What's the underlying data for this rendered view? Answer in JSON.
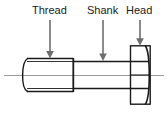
{
  "diagram": {
    "type": "engineering-line-drawing",
    "background_color": "#ffffff",
    "line_color": "#1a1a1a",
    "centerline_color": "#9a9a9a",
    "arrow_color": "#6e6e6e",
    "text_color": "#1a1a1a",
    "labels": [
      {
        "id": "thread",
        "text": "Thread",
        "x": 32,
        "y": 4,
        "arrow": {
          "x": 50,
          "from_y": 20,
          "to_y": 58
        }
      },
      {
        "id": "shank",
        "text": "Shank",
        "x": 87,
        "y": 4,
        "arrow": {
          "x": 103,
          "from_y": 20,
          "to_y": 60
        }
      },
      {
        "id": "head",
        "text": "Head",
        "x": 126,
        "y": 4,
        "arrow": {
          "x": 140,
          "from_y": 20,
          "to_y": 46
        }
      }
    ],
    "geometry": {
      "centerline": {
        "x1": 4,
        "x2": 164,
        "y": 75
      },
      "thread_section": {
        "x1": 27,
        "x2": 73,
        "top": 58,
        "bottom": 92
      },
      "chamfer_tip": {
        "x": 21,
        "top": 58,
        "bottom": 92
      },
      "shank_section": {
        "x1": 73,
        "x2": 130,
        "top": 61,
        "bottom": 89
      },
      "head_section": {
        "x1": 130,
        "x2": 150,
        "top": 46,
        "bottom": 104
      },
      "head_chamfer_lines_y": [
        61,
        75,
        89
      ]
    }
  }
}
